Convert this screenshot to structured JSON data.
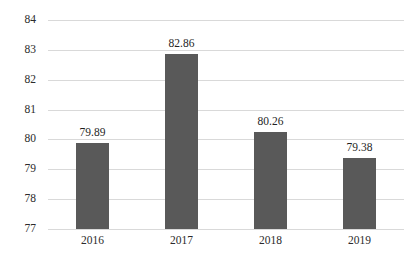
{
  "chart_data": {
    "type": "bar",
    "title": "",
    "subtitle": "",
    "xlabel": "",
    "ylabel": "",
    "categories": [
      "2016",
      "2017",
      "2018",
      "2019"
    ],
    "values": [
      79.89,
      82.86,
      80.26,
      79.38
    ],
    "value_labels": [
      "79.89",
      "82.86",
      "80.26",
      "79.38"
    ],
    "ylim": [
      77,
      84
    ],
    "y_ticks": [
      84,
      83,
      82,
      81,
      80,
      79,
      78,
      77
    ],
    "y_tick_labels": [
      "84",
      "83",
      "82",
      "81",
      "80",
      "79",
      "78",
      "77"
    ],
    "grid": true,
    "legend": false,
    "legend_position": "none",
    "series": [
      {
        "name": "",
        "values": [
          79.89,
          82.86,
          80.26,
          79.38
        ]
      }
    ]
  },
  "style": {
    "bar_color": "#595959",
    "gridline_color": "#d9d9d9",
    "background_color": "#ffffff",
    "label_color": "#1f1f1f",
    "tick_color": "#2b2b2b"
  }
}
